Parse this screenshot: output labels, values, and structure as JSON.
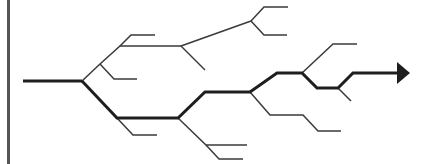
{
  "diagram": {
    "type": "branching-tree",
    "colors": {
      "thin_branch": "#3a3a3a",
      "main_path": "#1e1e1e",
      "left_bar": "#555555",
      "background": "#ffffff"
    },
    "left_bar": {
      "x": 7,
      "width": 3
    },
    "trunk": [
      [
        23,
        81
      ],
      [
        82,
        81
      ]
    ],
    "main_path": [
      [
        82,
        81
      ],
      [
        117,
        118
      ],
      [
        178,
        118
      ],
      [
        205,
        92
      ],
      [
        250,
        92
      ],
      [
        277,
        73
      ],
      [
        302,
        73
      ],
      [
        317,
        88
      ],
      [
        338,
        88
      ],
      [
        353,
        73
      ],
      [
        397,
        73
      ]
    ],
    "arrow_head": {
      "tip": [
        410,
        73
      ],
      "base_top": [
        397,
        62
      ],
      "base_bottom": [
        397,
        84
      ]
    },
    "branches": [
      [
        [
          82,
          81
        ],
        [
          100,
          64
        ],
        [
          120,
          46
        ],
        [
          181,
          46
        ]
      ],
      [
        [
          100,
          64
        ],
        [
          114,
          79
        ],
        [
          137,
          79
        ]
      ],
      [
        [
          120,
          46
        ],
        [
          131,
          35
        ],
        [
          155,
          35
        ]
      ],
      [
        [
          181,
          46
        ],
        [
          251,
          21
        ]
      ],
      [
        [
          181,
          46
        ],
        [
          205,
          70
        ]
      ],
      [
        [
          251,
          21
        ],
        [
          264,
          7
        ],
        [
          288,
          7
        ]
      ],
      [
        [
          251,
          21
        ],
        [
          264,
          35
        ],
        [
          287,
          35
        ]
      ],
      [
        [
          117,
          118
        ],
        [
          133,
          135
        ],
        [
          157,
          135
        ]
      ],
      [
        [
          178,
          118
        ],
        [
          206,
          145
        ],
        [
          247,
          145
        ]
      ],
      [
        [
          206,
          145
        ],
        [
          219,
          159
        ],
        [
          243,
          159
        ]
      ],
      [
        [
          250,
          92
        ],
        [
          270,
          115
        ],
        [
          303,
          115
        ],
        [
          318,
          131
        ],
        [
          341,
          131
        ]
      ],
      [
        [
          302,
          73
        ],
        [
          333,
          44
        ],
        [
          357,
          44
        ]
      ],
      [
        [
          338,
          88
        ],
        [
          351,
          101
        ]
      ]
    ]
  }
}
